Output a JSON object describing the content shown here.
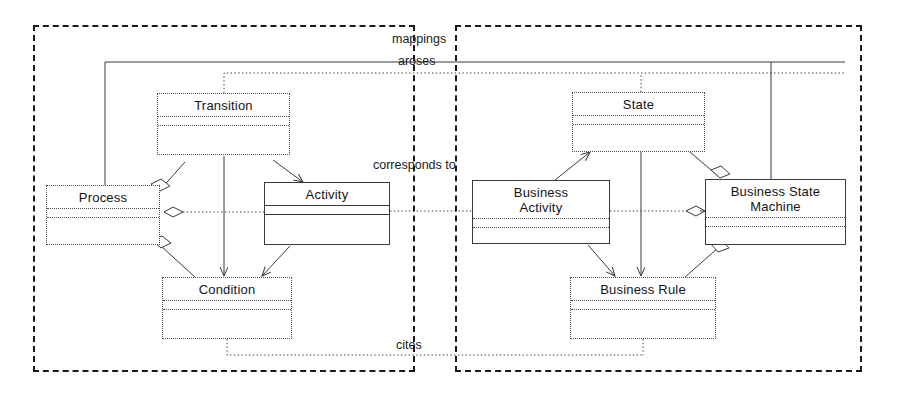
{
  "diagram": {
    "packages": [
      {
        "name": "left-package",
        "x": 33,
        "y": 25,
        "w": 382,
        "h": 347
      },
      {
        "name": "right-package",
        "x": 455,
        "y": 25,
        "w": 407,
        "h": 347
      }
    ],
    "classes": [
      {
        "id": "transition",
        "name": "Transition",
        "x": 157,
        "y": 93,
        "w": 133,
        "h": 62
      },
      {
        "id": "process",
        "name": "Process",
        "x": 46,
        "y": 185,
        "w": 114,
        "h": 60
      },
      {
        "id": "activity",
        "name": "Activity",
        "x": 264,
        "y": 182,
        "w": 126,
        "h": 63
      },
      {
        "id": "condition",
        "name": "Condition",
        "x": 162,
        "y": 277,
        "w": 130,
        "h": 62
      },
      {
        "id": "state",
        "name": "State",
        "x": 572,
        "y": 92,
        "w": 133,
        "h": 60
      },
      {
        "id": "business-activity",
        "name": "Business\nActivity",
        "x": 472,
        "y": 180,
        "w": 138,
        "h": 64
      },
      {
        "id": "business-state-machine",
        "name": "Business State\nMachine",
        "x": 705,
        "y": 179,
        "w": 141,
        "h": 66
      },
      {
        "id": "business-rule",
        "name": "Business Rule",
        "x": 570,
        "y": 277,
        "w": 146,
        "h": 62
      }
    ],
    "relationship_labels": [
      {
        "id": "mappings",
        "text": "mappings",
        "x": 392,
        "y": 32
      },
      {
        "id": "aroses",
        "text": "aroses",
        "x": 398,
        "y": 54
      },
      {
        "id": "corresponds-to",
        "text": "corresponds to",
        "x": 373,
        "y": 158
      },
      {
        "id": "cites",
        "text": "cites",
        "x": 396,
        "y": 338
      }
    ],
    "colors": {
      "class_border": "#4d4d4d",
      "package_border": "#1a1a1a",
      "connector": "#3a3a3a",
      "text": "#141414",
      "background": "#ffffff"
    }
  }
}
